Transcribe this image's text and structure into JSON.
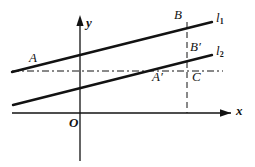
{
  "figure": {
    "kind": "geometry-diagram",
    "background_color": "#ffffff",
    "ink_color": "#121212"
  },
  "axes": {
    "x_label": "x",
    "y_label": "y",
    "origin_label": "O",
    "x_axis": {
      "y": 113,
      "x_start": 12,
      "x_end": 228
    },
    "y_axis": {
      "x": 80,
      "y_top": 18,
      "y_bottom": 161
    }
  },
  "lines": [
    {
      "id": "l1",
      "label": "l",
      "subscript": "1",
      "x1": 12,
      "y1": 72,
      "x2": 212,
      "y2": 22,
      "stroke_width": 2.4
    },
    {
      "id": "l2",
      "label": "l",
      "subscript": "2",
      "x1": 13,
      "y1": 105,
      "x2": 212,
      "y2": 55,
      "stroke_width": 2.4
    }
  ],
  "guides": [
    {
      "id": "horizontal-dashdot",
      "orientation": "horizontal",
      "y": 71,
      "x1": 12,
      "x2": 223,
      "dash": "7,3,2,3"
    },
    {
      "id": "vertical-dashdot",
      "orientation": "vertical",
      "x": 187,
      "y1": 22,
      "y2": 113,
      "dash": "6,4"
    }
  ],
  "points": [
    {
      "id": "A",
      "label": "A",
      "prime": false,
      "x": 29,
      "y": 51
    },
    {
      "id": "B",
      "label": "B",
      "prime": false,
      "x": 174,
      "y": 8
    },
    {
      "id": "Bp",
      "label": "B",
      "prime": true,
      "x": 190,
      "y": 40
    },
    {
      "id": "Ap",
      "label": "A",
      "prime": true,
      "x": 152,
      "y": 70
    },
    {
      "id": "C",
      "label": "C",
      "prime": false,
      "x": 192,
      "y": 70
    }
  ],
  "line_labels": [
    {
      "id": "l1-label",
      "x": 216,
      "y": 11
    },
    {
      "id": "l2-label",
      "x": 216,
      "y": 44
    }
  ],
  "axis_labels": {
    "y_pos": {
      "x": 86,
      "y": 16
    },
    "x_pos": {
      "x": 236,
      "y": 104
    },
    "origin_pos": {
      "x": 69,
      "y": 116
    }
  }
}
